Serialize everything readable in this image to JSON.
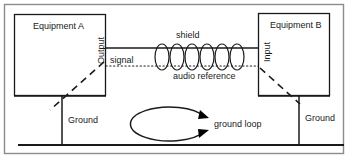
{
  "diagram": {
    "frame": {
      "stroke": "#8c8c8c",
      "x": 4,
      "y": 4,
      "width": 340,
      "height": 150
    },
    "line_color": "#1a1a1a",
    "equipment_a": {
      "label": "Equipment A",
      "port_label": "Output",
      "ground_label": "Ground",
      "box": {
        "x": 14,
        "y": 14,
        "width": 92,
        "height": 82
      }
    },
    "equipment_b": {
      "label": "Equipment B",
      "port_label": "Input",
      "ground_label": "Ground",
      "box": {
        "x": 258,
        "y": 13,
        "width": 72,
        "height": 83
      }
    },
    "cable": {
      "signal_label": "signal",
      "audio_reference_label": "audio reference",
      "shield_label": "shield",
      "shield_turns": 6,
      "signal_y": 48,
      "reference_y": 66
    },
    "ground_bus": {
      "y": 145,
      "x_start": 18,
      "x_end": 344
    },
    "ground_loop": {
      "label": "ground loop",
      "center_x": 166,
      "center_y": 124,
      "rx": 39,
      "ry": 17
    }
  }
}
